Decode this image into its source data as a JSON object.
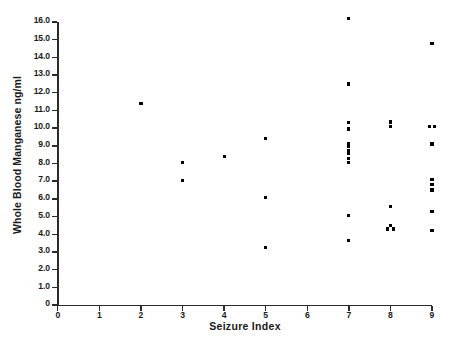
{
  "chart_data": {
    "type": "scatter",
    "title": "",
    "xlabel": "Seizure Index",
    "ylabel": "Whole Blood Manganese ng/ml",
    "xlim": [
      0,
      9
    ],
    "ylim": [
      0,
      16
    ],
    "grid": false,
    "legend": null,
    "xticks": [
      "0",
      "1",
      "2",
      "3",
      "4",
      "5",
      "6",
      "7",
      "8",
      "9"
    ],
    "xtick_values": [
      0,
      1,
      2,
      3,
      4,
      5,
      6,
      7,
      8,
      9
    ],
    "yticks": [
      "0",
      "1.0",
      "2.0",
      "3.0",
      "4.0",
      "5.0",
      "6.0",
      "7.0",
      "8.0",
      "9.0",
      "10.0",
      "11.0",
      "12.0",
      "13.0",
      "14.0",
      "15.0",
      "16.0"
    ],
    "ytick_values": [
      0,
      1,
      2,
      3,
      4,
      5,
      6,
      7,
      8,
      9,
      10,
      11,
      12,
      13,
      14,
      15,
      16
    ],
    "marker": "square-dot",
    "marker_color": "#000000",
    "points": [
      {
        "x": 2.0,
        "y": 11.4
      },
      {
        "x": 3.0,
        "y": 8.05
      },
      {
        "x": 3.0,
        "y": 7.05
      },
      {
        "x": 4.0,
        "y": 8.4
      },
      {
        "x": 5.0,
        "y": 9.4
      },
      {
        "x": 5.0,
        "y": 6.1
      },
      {
        "x": 5.0,
        "y": 3.25
      },
      {
        "x": 7.0,
        "y": 16.2
      },
      {
        "x": 7.0,
        "y": 12.5
      },
      {
        "x": 7.0,
        "y": 10.3
      },
      {
        "x": 7.0,
        "y": 9.95
      },
      {
        "x": 7.0,
        "y": 9.15
      },
      {
        "x": 7.0,
        "y": 8.95
      },
      {
        "x": 7.0,
        "y": 8.75
      },
      {
        "x": 7.0,
        "y": 8.55
      },
      {
        "x": 7.0,
        "y": 8.3
      },
      {
        "x": 7.0,
        "y": 8.05
      },
      {
        "x": 7.0,
        "y": 5.05
      },
      {
        "x": 7.0,
        "y": 3.65
      },
      {
        "x": 8.0,
        "y": 10.35
      },
      {
        "x": 8.0,
        "y": 10.1
      },
      {
        "x": 8.0,
        "y": 5.55
      },
      {
        "x": 8.0,
        "y": 4.5
      },
      {
        "x": 7.93,
        "y": 4.3
      },
      {
        "x": 8.07,
        "y": 4.3
      },
      {
        "x": 9.0,
        "y": 14.8
      },
      {
        "x": 8.94,
        "y": 10.1
      },
      {
        "x": 9.06,
        "y": 10.1
      },
      {
        "x": 9.0,
        "y": 9.1
      },
      {
        "x": 9.0,
        "y": 7.1
      },
      {
        "x": 9.0,
        "y": 6.8
      },
      {
        "x": 9.0,
        "y": 6.5
      },
      {
        "x": 9.0,
        "y": 5.3
      },
      {
        "x": 9.0,
        "y": 4.2
      }
    ]
  }
}
